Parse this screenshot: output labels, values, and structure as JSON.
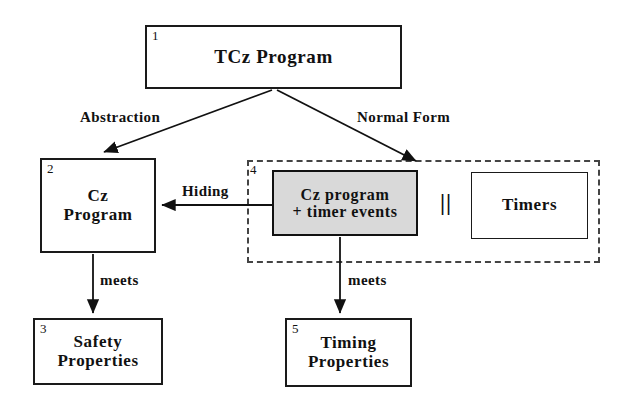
{
  "diagram": {
    "nodes": [
      {
        "id": "tcz",
        "number": "1",
        "label": "TCz Program",
        "fill": "#ffffff"
      },
      {
        "id": "cz",
        "number": "2",
        "label": "Cz\nProgram",
        "fill": "#ffffff"
      },
      {
        "id": "safety",
        "number": "3",
        "label": "Safety\nProperties",
        "fill": "#ffffff"
      },
      {
        "id": "czt",
        "number": "4",
        "label": "Cz program\n+ timer events",
        "fill": "#d9d9d9"
      },
      {
        "id": "timing",
        "number": "5",
        "label": "Timing\nProperties",
        "fill": "#ffffff"
      },
      {
        "id": "timers",
        "number": "",
        "label": "Timers",
        "fill": "#ffffff"
      }
    ],
    "edges": [
      {
        "id": "abstraction",
        "label": "Abstraction",
        "from": "tcz",
        "to": "cz"
      },
      {
        "id": "normalform",
        "label": "Normal Form",
        "from": "tcz",
        "to": "czt"
      },
      {
        "id": "hiding",
        "label": "Hiding",
        "from": "czt",
        "to": "cz"
      },
      {
        "id": "meets-left",
        "label": "meets",
        "from": "cz",
        "to": "safety"
      },
      {
        "id": "meets-right",
        "label": "meets",
        "from": "czt",
        "to": "timing"
      }
    ],
    "operator": "||",
    "region": {
      "number": "4",
      "style": "dashed"
    },
    "colors": {
      "stroke": "#111111",
      "dashed_stroke": "#444444",
      "highlight_fill": "#d9d9d9",
      "background": "#ffffff"
    }
  }
}
